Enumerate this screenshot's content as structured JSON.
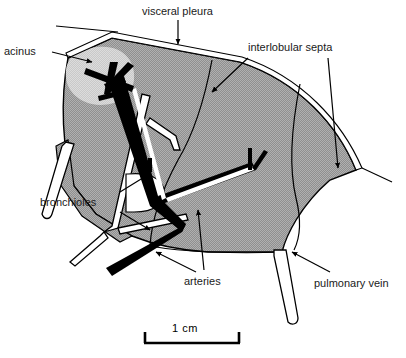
{
  "figure": {
    "title_absent": true,
    "kind": "lung-lobule-anatomical-diagram",
    "labels": [
      {
        "id": "acinus",
        "text": "acinus",
        "x": 4,
        "y": 45
      },
      {
        "id": "visceral-pleura",
        "text": "visceral pleura",
        "x": 142,
        "y": 5
      },
      {
        "id": "interlobular-septa",
        "text": "interlobular septa",
        "x": 248,
        "y": 41
      },
      {
        "id": "bronchioles",
        "text": "bronchioles",
        "x": 40,
        "y": 196
      },
      {
        "id": "arteries",
        "text": "arteries",
        "x": 184,
        "y": 275
      },
      {
        "id": "pulmonary-vein",
        "text": "pulmonary vein",
        "x": 314,
        "y": 277
      }
    ],
    "scale_bar": {
      "text": "1 cm",
      "label_x": 172,
      "label_y": 322,
      "x1": 144,
      "x2": 240,
      "y": 343,
      "tick_height": 11
    },
    "colors": {
      "parenchyma_gray": "#9b9b9b",
      "acinus_gray": "#cfcfcf",
      "outline_black": "#000000",
      "vessel_white": "#ffffff",
      "artery_black": "#000000",
      "page_white": "#ffffff",
      "text_black": "#1a1a1a"
    },
    "structures": [
      {
        "name": "parenchyma-wedge",
        "fill": "parenchyma_gray",
        "stroke": "outline_black"
      },
      {
        "name": "acinus-blob",
        "fill": "acinus_gray",
        "stroke": "none"
      },
      {
        "name": "visceral-pleura-strip",
        "fill": "vessel_white",
        "stroke": "outline_black"
      },
      {
        "name": "bronchiole-tree",
        "fill": "vessel_white",
        "stroke": "outline_black"
      },
      {
        "name": "artery-tree",
        "fill": "artery_black",
        "stroke": "artery_black"
      },
      {
        "name": "pulmonary-vein-tube",
        "fill": "vessel_white",
        "stroke": "outline_black"
      },
      {
        "name": "interlobular-septa-lines",
        "fill": "none",
        "stroke": "outline_black"
      }
    ]
  }
}
